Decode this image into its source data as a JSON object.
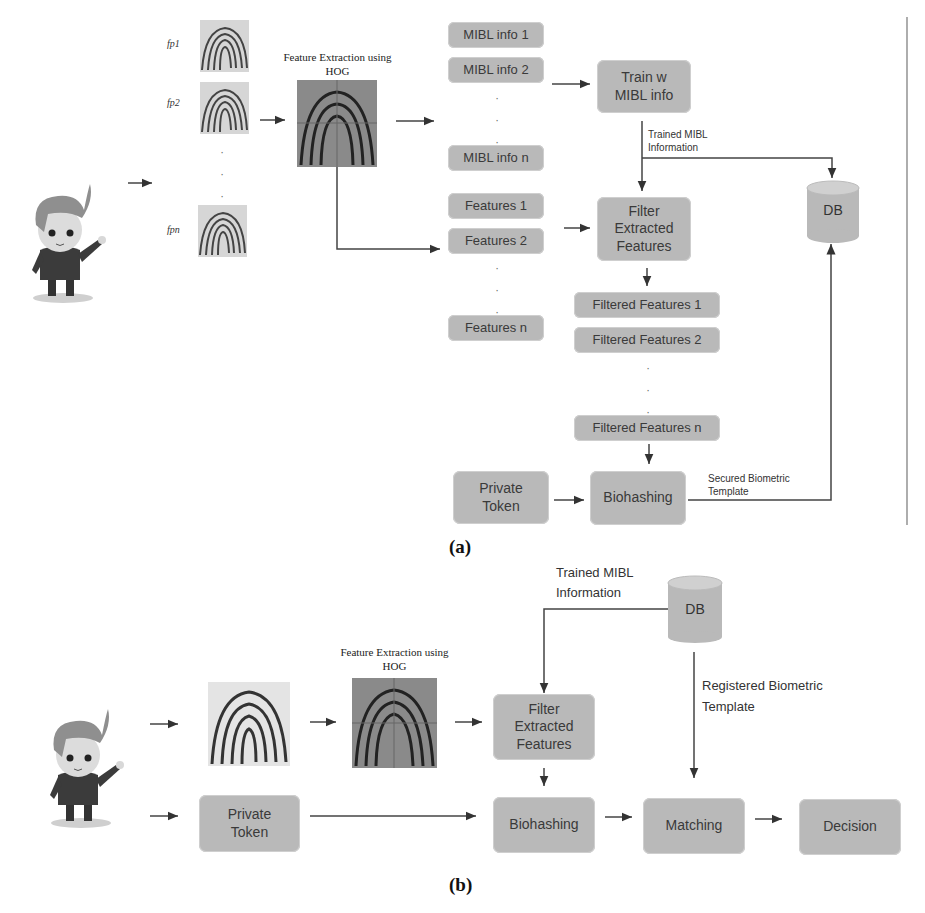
{
  "panel_a": {
    "caption": "(a)",
    "fingerprints": [
      {
        "label": "fp1"
      },
      {
        "label": "fp2"
      },
      {
        "label": "fpn"
      }
    ],
    "hog_title_line1": "Feature Extraction using",
    "hog_title_line2": "HOG",
    "mibl_boxes": [
      "MIBL info 1",
      "MIBL info 2",
      "MIBL info n"
    ],
    "feature_boxes": [
      "Features 1",
      "Features 2",
      "Features n"
    ],
    "train_box_line1": "Train w",
    "train_box_line2": "MIBL info",
    "trained_label_line1": "Trained MIBL",
    "trained_label_line2": "Information",
    "filter_box_line1": "Filter",
    "filter_box_line2": "Extracted",
    "filter_box_line3": "Features",
    "filtered_boxes": [
      "Filtered Features 1",
      "Filtered Features 2",
      "Filtered Features n"
    ],
    "private_token_line1": "Private",
    "private_token_line2": "Token",
    "biohashing": "Biohashing",
    "secured_label_line1": "Secured Biometric",
    "secured_label_line2": "Template",
    "db": "DB"
  },
  "panel_b": {
    "caption": "(b)",
    "hog_title_line1": "Feature Extraction using",
    "hog_title_line2": "HOG",
    "trained_label_line1": "Trained MIBL",
    "trained_label_line2": "Information",
    "db": "DB",
    "registered_label_line1": "Registered Biometric",
    "registered_label_line2": "Template",
    "filter_box_line1": "Filter",
    "filter_box_line2": "Extracted",
    "filter_box_line3": "Features",
    "private_token_line1": "Private",
    "private_token_line2": "Token",
    "biohashing": "Biohashing",
    "matching": "Matching",
    "decision": "Decision"
  },
  "colors": {
    "box_fill": "#b9b9b9",
    "line": "#333333",
    "text": "#3a3a3a"
  }
}
